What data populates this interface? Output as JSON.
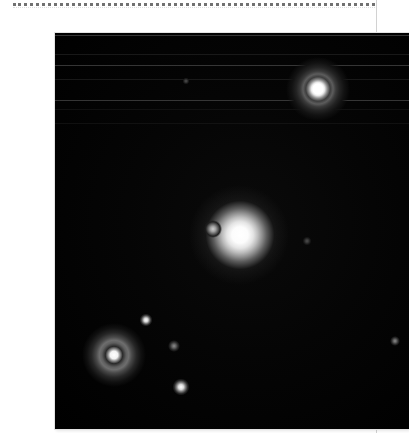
{
  "page": {
    "background_color": "#ffffff",
    "top_rule": {
      "style": "dotted",
      "color": "#4a4a4a"
    },
    "right_edge_rule_color": "#d2d2d2"
  },
  "figure": {
    "kind": "astronomical-image",
    "frame": {
      "x": 15,
      "y": 17,
      "width": 354,
      "height": 396
    },
    "background_color": "#000000",
    "highlight_color": "#ffffff",
    "caption": "",
    "axis_labels": [],
    "tick_labels": [],
    "annotations": []
  },
  "objects": [
    {
      "id": "star-top-right",
      "name": "bright star with diffraction halo",
      "x_pct": 74.3,
      "y_pct": 14.1,
      "size_px": 64,
      "core_size_px": 15,
      "brightness": "very-bright"
    },
    {
      "id": "central-blob",
      "name": "extended bright central source",
      "x_pct": 52.3,
      "y_pct": 51.0,
      "size_px": 76,
      "core_size_px": 42,
      "brightness": "very-bright"
    },
    {
      "id": "blob-companion",
      "name": "faint companion west of central source",
      "x_pct": 44.6,
      "y_pct": 49.5,
      "size_px": 20,
      "brightness": "faint"
    },
    {
      "id": "star-bottom-left",
      "name": "star with ring-shaped halo",
      "x_pct": 16.7,
      "y_pct": 81.3,
      "size_px": 62,
      "core_size_px": 13,
      "brightness": "bright"
    },
    {
      "id": "point-a",
      "name": "small point source upper of bottom group",
      "x_pct": 25.7,
      "y_pct": 72.5,
      "size_px": 13,
      "brightness": "medium"
    },
    {
      "id": "point-b",
      "name": "small faint point source",
      "x_pct": 33.6,
      "y_pct": 79.0,
      "size_px": 11,
      "brightness": "faint"
    },
    {
      "id": "point-c",
      "name": "bright small point source lower centre",
      "x_pct": 35.6,
      "y_pct": 89.4,
      "size_px": 16,
      "brightness": "bright"
    },
    {
      "id": "point-right-edge",
      "name": "faint point source near right edge",
      "x_pct": 96.0,
      "y_pct": 77.8,
      "size_px": 9,
      "brightness": "faint"
    },
    {
      "id": "point-right-of-blob",
      "name": "very faint point right of central source",
      "x_pct": 71.2,
      "y_pct": 52.5,
      "size_px": 8,
      "brightness": "very-faint"
    },
    {
      "id": "point-top-faint",
      "name": "very faint point in upper field",
      "x_pct": 37.0,
      "y_pct": 12.0,
      "size_px": 7,
      "brightness": "very-faint"
    }
  ],
  "scanlines": [
    {
      "y_px": 2,
      "intensity": "bright"
    },
    {
      "y_px": 21,
      "intensity": "normal"
    },
    {
      "y_px": 32,
      "intensity": "bright"
    },
    {
      "y_px": 46,
      "intensity": "normal"
    },
    {
      "y_px": 67,
      "intensity": "bright"
    },
    {
      "y_px": 76,
      "intensity": "dim"
    },
    {
      "y_px": 90,
      "intensity": "dim"
    }
  ]
}
